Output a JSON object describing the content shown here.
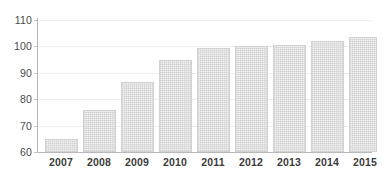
{
  "chart_data": {
    "type": "bar",
    "title": "",
    "subtitle": "",
    "xlabel": "",
    "ylabel": "",
    "categories": [
      "2007",
      "2008",
      "2009",
      "2010",
      "2011",
      "2012",
      "2013",
      "2014",
      "2015"
    ],
    "values": [
      64.8,
      76.0,
      86.5,
      94.8,
      99.3,
      100.2,
      100.7,
      102.2,
      103.5
    ],
    "series": [
      {
        "name": "",
        "values": [
          64.8,
          76.0,
          86.5,
          94.8,
          99.3,
          100.2,
          100.7,
          102.2,
          103.5
        ]
      }
    ],
    "ylim": [
      60,
      110
    ],
    "yticks": [
      60,
      70,
      80,
      90,
      100,
      110
    ],
    "ytick_labels": [
      "60",
      "70",
      "80",
      "90",
      "100",
      "110"
    ],
    "xtick_labels": [
      "2007",
      "2008",
      "2009",
      "2010",
      "2011",
      "2012",
      "2013",
      "2014",
      "2015"
    ],
    "grid": true,
    "grid_axis": "y",
    "legend": false,
    "legend_position": "none",
    "annotations": [],
    "colors": {
      "bar_fill": "#f2f2f2",
      "bar_pattern": "#cdcdcd",
      "bar_border": "#d2d2d2",
      "gridline": "#eeeeee",
      "axis_line": "#b9b9b9",
      "tick_label": "#4a4a4a",
      "category_label": "#3c3c3c",
      "background": "#ffffff"
    }
  }
}
